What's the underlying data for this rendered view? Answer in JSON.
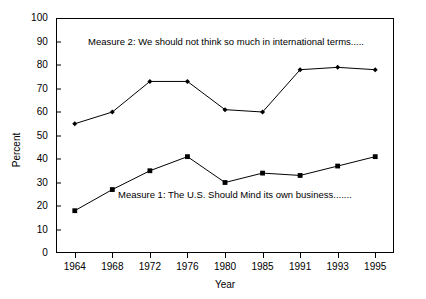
{
  "chart_data": {
    "type": "line",
    "title": "",
    "xlabel": "Year",
    "ylabel": "Percent",
    "categories": [
      "1964",
      "1968",
      "1972",
      "1976",
      "1980",
      "1985",
      "1991",
      "1993",
      "1995"
    ],
    "ylim": [
      0,
      100
    ],
    "ytick_step": 10,
    "yticks": [
      "100",
      "90",
      "80",
      "70",
      "60",
      "50",
      "40",
      "30",
      "20",
      "10",
      "0"
    ],
    "grid": false,
    "legend_position": "none",
    "series": [
      {
        "name": "Measure 2",
        "marker": "diamond",
        "color": "#000000",
        "values": [
          55,
          60,
          73,
          73,
          61,
          60,
          78,
          79,
          78
        ]
      },
      {
        "name": "Measure 1",
        "marker": "square",
        "color": "#000000",
        "values": [
          18,
          27,
          35,
          41,
          30,
          34,
          33,
          37,
          41
        ]
      }
    ],
    "annotations": [
      {
        "id": "measure2",
        "text": "Measure 2: We should not think so much in international terms....."
      },
      {
        "id": "measure1",
        "text": "Measure 1: The U.S. Should Mind its own business......."
      }
    ]
  }
}
